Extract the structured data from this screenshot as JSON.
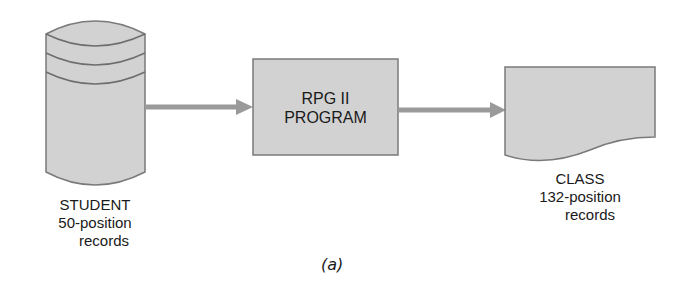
{
  "figure": {
    "caption": "(a)",
    "colors": {
      "fill": "#d2d2d2",
      "stroke": "#7a7a7a",
      "arrow": "#9a9a9a",
      "text": "#1a1a1a"
    },
    "nodes": [
      {
        "id": "student",
        "shape": "disk-cylinder",
        "lines": [
          "STUDENT",
          "50-position",
          "records"
        ]
      },
      {
        "id": "program",
        "shape": "process-box",
        "lines": [
          "RPG II",
          "PROGRAM"
        ]
      },
      {
        "id": "class",
        "shape": "document",
        "lines": [
          "CLASS",
          "132-position",
          "records"
        ]
      }
    ],
    "edges": [
      {
        "from": "student",
        "to": "program"
      },
      {
        "from": "program",
        "to": "class"
      }
    ]
  }
}
